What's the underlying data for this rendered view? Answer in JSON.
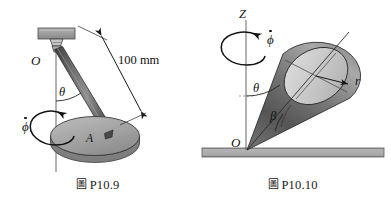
{
  "sheet": {
    "background_color": "#ffffff",
    "width": 391,
    "height": 199
  },
  "palette": {
    "ink": "#111111",
    "line": "#2b2b2b",
    "mid_gray": "#9a9a9a",
    "light_gray": "#c9c9c9",
    "pale_gray": "#d9d9d9",
    "dark_gray": "#4f4f4f",
    "ground_gray": "#a8a8a8",
    "disk_gray": "#a5a5a5",
    "cone_light": "#cfcfcf",
    "cone_dark": "#555555"
  },
  "figures": [
    {
      "id": "fig-p10-9",
      "caption_mark": "圖",
      "caption_label": "P10.9",
      "description": "Rod pinned at O to an overhead bracket, carrying disk A, spinning about the vertical axis",
      "labels": {
        "origin": "O",
        "dimension": "100 mm",
        "angle_theta": "θ",
        "spin_rate": "ϕ",
        "disk": "A"
      }
    },
    {
      "id": "fig-p10-10",
      "caption_mark": "圖",
      "caption_label": "P10.10",
      "description": "Cone with apex at O rolling on the ground, precessing about the vertical Z axis",
      "labels": {
        "axis": "Z",
        "origin": "O",
        "precession_rate": "ϕ",
        "angle_theta": "θ",
        "angle_beta": "β",
        "radius": "r"
      }
    }
  ]
}
